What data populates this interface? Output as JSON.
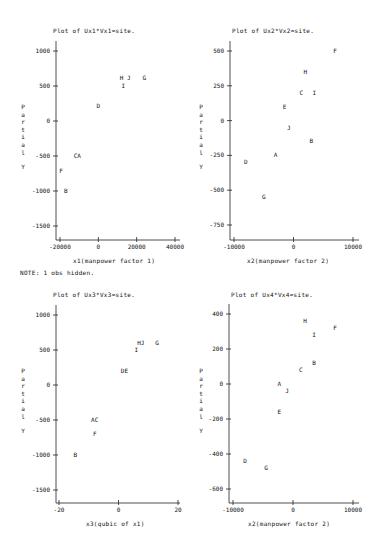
{
  "note": "NOTE: 1 obs hidden.",
  "chart_data": [
    {
      "type": "scatter",
      "title": "Plot of Ux1*Vx1=site.",
      "xlabel": "x1(manpower factor 1)",
      "ylabel": "Partial Y",
      "xticks": [
        -20000,
        0,
        20000,
        40000
      ],
      "yticks": [
        1000,
        500,
        0,
        -500,
        -1000,
        -1500
      ],
      "xlim": [
        -22000,
        42000
      ],
      "ylim": [
        -1700,
        1150
      ],
      "points": [
        {
          "label": "H J",
          "x": 14000,
          "y": 610
        },
        {
          "label": "G",
          "x": 24000,
          "y": 610
        },
        {
          "label": "I",
          "x": 13000,
          "y": 500
        },
        {
          "label": "D",
          "x": 0,
          "y": 210
        },
        {
          "label": "CA",
          "x": -11000,
          "y": -500
        },
        {
          "label": "F",
          "x": -19500,
          "y": -720
        },
        {
          "label": "B",
          "x": -17000,
          "y": -1000
        }
      ]
    },
    {
      "type": "scatter",
      "title": "Plot of Ux2*Vx2=site.",
      "xlabel": "x2(manpower factor 2)",
      "ylabel": "Partial Y",
      "xticks": [
        -10000,
        0,
        10000
      ],
      "yticks": [
        500,
        250,
        0,
        -250,
        -500,
        -750
      ],
      "xlim": [
        -10700,
        11000
      ],
      "ylim": [
        -870,
        560
      ],
      "points": [
        {
          "label": "F",
          "x": 7000,
          "y": 500
        },
        {
          "label": "H",
          "x": 2000,
          "y": 350
        },
        {
          "label": "C",
          "x": 1300,
          "y": 200
        },
        {
          "label": "I",
          "x": 3500,
          "y": 200
        },
        {
          "label": "E",
          "x": -1500,
          "y": 100
        },
        {
          "label": "J",
          "x": -800,
          "y": -50
        },
        {
          "label": "B",
          "x": 3000,
          "y": -150
        },
        {
          "label": "A",
          "x": -3000,
          "y": -250
        },
        {
          "label": "D",
          "x": -8000,
          "y": -300
        },
        {
          "label": "G",
          "x": -5000,
          "y": -550
        }
      ]
    },
    {
      "type": "scatter",
      "title": "Plot of Ux3*Vx3=site.",
      "xlabel": "x3(qubic of x1)",
      "ylabel": "Partial Y",
      "xticks": [
        -20,
        0,
        20
      ],
      "yticks": [
        1000,
        500,
        0,
        -500,
        -1000,
        -1500
      ],
      "xlim": [
        -21.5,
        21.5
      ],
      "ylim": [
        -1700,
        1150
      ],
      "points": [
        {
          "label": "HJ",
          "x": 7.5,
          "y": 600
        },
        {
          "label": "G",
          "x": 13,
          "y": 600
        },
        {
          "label": "I",
          "x": 6,
          "y": 500
        },
        {
          "label": "DE",
          "x": 2,
          "y": 200
        },
        {
          "label": "AC",
          "x": -8,
          "y": -500
        },
        {
          "label": "F",
          "x": -8,
          "y": -700
        },
        {
          "label": "B",
          "x": -14.5,
          "y": -1000
        }
      ]
    },
    {
      "type": "scatter",
      "title": "Plot of Ux4*Vx4=site.",
      "xlabel": "x2(manpower factor 2)",
      "ylabel": "Partial Y",
      "xticks": [
        -10000,
        0,
        10000
      ],
      "yticks": [
        400,
        200,
        0,
        -200,
        -400,
        -600
      ],
      "xlim": [
        -10700,
        11000
      ],
      "ylim": [
        -690,
        460
      ],
      "points": [
        {
          "label": "H",
          "x": 2000,
          "y": 360
        },
        {
          "label": "F",
          "x": 7000,
          "y": 320
        },
        {
          "label": "I",
          "x": 3500,
          "y": 280
        },
        {
          "label": "B",
          "x": 3500,
          "y": 120
        },
        {
          "label": "C",
          "x": 1300,
          "y": 80
        },
        {
          "label": "A",
          "x": -2300,
          "y": 0
        },
        {
          "label": "J",
          "x": -1000,
          "y": -40
        },
        {
          "label": "E",
          "x": -2300,
          "y": -160
        },
        {
          "label": "D",
          "x": -8000,
          "y": -440
        },
        {
          "label": "G",
          "x": -4500,
          "y": -480
        }
      ]
    }
  ],
  "layout": [
    {
      "left": 0,
      "top": 0,
      "axis_x": 56,
      "axis_bottom": 240,
      "plot_right": 180,
      "plot_top": 41,
      "title_x": 53,
      "title_y": 27,
      "xlabel_x": 73,
      "xlabel_y": 257,
      "ylab_x": 20,
      "ylab_y": 103
    },
    {
      "left": 0,
      "top": 0,
      "axis_x": 230,
      "axis_bottom": 240,
      "plot_right": 359,
      "plot_top": 41,
      "title_x": 232,
      "title_y": 27,
      "xlabel_x": 247,
      "xlabel_y": 257,
      "ylab_x": 198,
      "ylab_y": 103
    },
    {
      "left": 0,
      "top": 0,
      "axis_x": 56,
      "axis_bottom": 503,
      "plot_right": 180,
      "plot_top": 305,
      "title_x": 53,
      "title_y": 291,
      "xlabel_x": 86,
      "xlabel_y": 520,
      "ylab_x": 20,
      "ylab_y": 367
    },
    {
      "left": 0,
      "top": 0,
      "axis_x": 229,
      "axis_bottom": 503,
      "plot_right": 359,
      "plot_top": 304,
      "title_x": 231,
      "title_y": 291,
      "xlabel_x": 248,
      "xlabel_y": 520,
      "ylab_x": 198,
      "ylab_y": 367
    }
  ],
  "pixel_map": [
    {
      "x0": -20000,
      "px0": 60,
      "x1": 40000,
      "px1": 175,
      "y0": 1000,
      "py0": 51,
      "y1": -1500,
      "py1": 226
    },
    {
      "x0": -10000,
      "px0": 234,
      "x1": 10000,
      "px1": 353,
      "y0": 500,
      "py0": 51,
      "y1": -750,
      "py1": 225
    },
    {
      "x0": -20,
      "px0": 59,
      "x1": 20,
      "px1": 178,
      "y0": 1000,
      "py0": 315,
      "y1": -1500,
      "py1": 490
    },
    {
      "x0": -10000,
      "px0": 233,
      "x1": 10000,
      "px1": 353,
      "y0": 400,
      "py0": 314,
      "y1": -600,
      "py1": 489
    }
  ],
  "note_pos": {
    "x": 20,
    "y": 269
  }
}
